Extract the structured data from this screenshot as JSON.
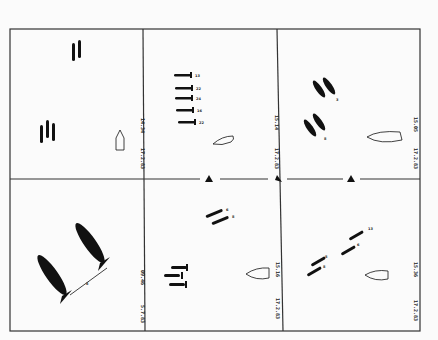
{
  "figure": {
    "layout": "2x3 grid of sighting sketches",
    "frame_color": "#333333",
    "ink_color": "#111111",
    "background": "#fbfbfb"
  },
  "panels": [
    {
      "id": "top-left",
      "date": "17.2.83",
      "time": "14.34",
      "objects": [
        "vertical pair",
        "vertical triple",
        "ship outline"
      ]
    },
    {
      "id": "top-middle",
      "date": "17.2.83",
      "time": "15.14",
      "objects": [
        "column of 5 horizontal shapes",
        "ship outline"
      ],
      "tags": [
        "13",
        "22",
        "24",
        "16",
        "22"
      ]
    },
    {
      "id": "top-right",
      "date": "17.2.83",
      "time": "15.05",
      "objects": [
        "diagonal pair upper",
        "diagonal pair lower",
        "ship outline"
      ],
      "tags": [
        "3",
        "8"
      ]
    },
    {
      "id": "bottom-left",
      "date": "5.7.83",
      "time": "09.46",
      "objects": [
        "two large diagonal shapes",
        "distance marker"
      ],
      "tags": [
        "8"
      ]
    },
    {
      "id": "bottom-middle",
      "date": "17.2.83",
      "time": "15.16",
      "objects": [
        "diagonal pair",
        "horizontal triple",
        "ship outline"
      ],
      "tags": [
        "6",
        "8"
      ]
    },
    {
      "id": "bottom-right",
      "date": "17.2.83",
      "time": "15.36",
      "objects": [
        "diagonal line of 4 shapes",
        "ship outline"
      ],
      "tags": [
        "13",
        "6",
        "8",
        "8"
      ]
    }
  ],
  "divider_markers": [
    "triangle",
    "triangle",
    "triangle"
  ]
}
